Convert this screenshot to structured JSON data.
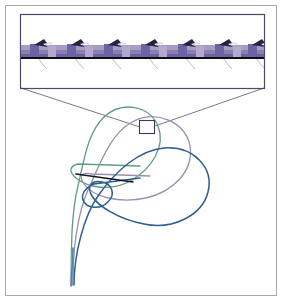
{
  "figure": {
    "title": "Supercoiled filament plectoneme with magnified inset",
    "background_color": "#ffffff",
    "outer_frame": {
      "stroke": "#a8a8a8",
      "stroke_width": 1,
      "x": 5,
      "y": 5,
      "width": 271,
      "height": 290
    }
  },
  "inset": {
    "label": "magnified-segment-inset",
    "border_color": "#4a4a66",
    "border_width": 1.2,
    "x": 20,
    "y": 14,
    "width": 244,
    "height": 74,
    "fill": "#ffffff",
    "band": {
      "label": "filament-ribbon",
      "top_color": "#9f93c0",
      "mid_color": "#8b7fb0",
      "bottom_color": "#6e63a0",
      "edge_color": "#5a5080",
      "y": 46,
      "height": 11,
      "x_start": 21,
      "x_end": 263
    },
    "axis_line": {
      "label": "filament-axis",
      "color": "#0d0d1a",
      "width": 2,
      "y": 58,
      "x_start": 21,
      "x_end": 263
    },
    "repeat_units": [
      {
        "x": 34,
        "arrow": "up-right"
      },
      {
        "x": 71,
        "arrow": "up-right"
      },
      {
        "x": 108,
        "arrow": "up-right"
      },
      {
        "x": 145,
        "arrow": "up-right"
      },
      {
        "x": 182,
        "arrow": "up-right"
      },
      {
        "x": 219,
        "arrow": "up-right"
      },
      {
        "x": 252,
        "arrow": "up-right"
      }
    ],
    "arrow_color": "#2a2040",
    "bristle_color": "#b9b4c9",
    "block_color": "#6d62a2"
  },
  "leader_lines": {
    "label": "inset-leader-lines",
    "color": "#3c3c5c",
    "width": 0.7,
    "from_left": {
      "x1": 20,
      "y1": 88,
      "x2": 139,
      "y2": 126
    },
    "from_right": {
      "x1": 264,
      "y1": 88,
      "x2": 152,
      "y2": 126
    }
  },
  "marker_box": {
    "label": "zoom-region-marker",
    "x": 139,
    "y": 120,
    "width": 15,
    "height": 13,
    "stroke": "#3a3a55",
    "stroke_width": 1.1,
    "fill": "#ffffff"
  },
  "curves": [
    {
      "name": "configuration-green",
      "color": "#5e9d7e",
      "width": 1.3,
      "description": "outer open plectoneme loop"
    },
    {
      "name": "configuration-mauve",
      "color": "#9a8fae",
      "width": 1.3,
      "description": "intermediate plectoneme loop"
    },
    {
      "name": "configuration-blue",
      "color": "#2e5f8f",
      "width": 1.5,
      "description": "inner collapsed plectoneme loop with crossing"
    }
  ],
  "chord": {
    "label": "contact-chord",
    "color": "#101822",
    "width": 1.6,
    "x1": 75,
    "y1": 174,
    "x2": 132,
    "y2": 181
  },
  "tail": {
    "label": "filament-tail",
    "x": 72,
    "y_top": 245,
    "y_bottom": 285
  }
}
